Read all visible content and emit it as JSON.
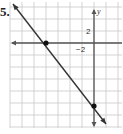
{
  "problem": {
    "number_label": "5."
  },
  "chart_data": {
    "type": "line",
    "title": "",
    "xlabel": "",
    "ylabel": "y",
    "grid": true,
    "grid_step": 2,
    "xlim": [
      -14,
      4
    ],
    "ylim": [
      -14,
      6
    ],
    "tick_labels": [
      {
        "axis": "x",
        "value": -2,
        "text": "−2"
      },
      {
        "axis": "y",
        "value": 2,
        "text": "2"
      }
    ],
    "series": [
      {
        "name": "line",
        "x": [
          -13.5,
          2
        ],
        "y": [
          6.5,
          -13.5
        ]
      }
    ],
    "points": [
      {
        "name": "x-intercept",
        "x": -8,
        "y": 0
      },
      {
        "name": "y-intercept",
        "x": 0,
        "y": -10.5
      }
    ],
    "colors": {
      "grid": "#c8c8c8",
      "axis": "#555555",
      "line": "#333333",
      "point": "#111111"
    }
  }
}
